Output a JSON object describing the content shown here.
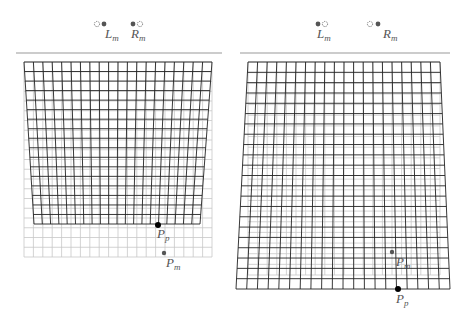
{
  "panels": [
    {
      "name": "left-panel",
      "rule": {
        "x1": 16,
        "x2": 222,
        "y": 53
      },
      "eyes": [
        {
          "label": "L",
          "sub": "m",
          "dashed_x": 97,
          "solid_x": 104,
          "y": 24,
          "label_x": 105,
          "label_y": 27
        },
        {
          "label": "R",
          "sub": "m",
          "dashed_x": 140,
          "solid_x": 133,
          "y": 24,
          "label_x": 131,
          "label_y": 27
        }
      ],
      "underlay": {
        "tl": [
          24,
          62
        ],
        "tr": [
          212,
          62
        ],
        "bl": [
          24,
          257
        ],
        "br": [
          212,
          257
        ],
        "cols": 20,
        "rows": 20
      },
      "grid": {
        "tl": [
          24,
          62
        ],
        "tr": [
          212,
          62
        ],
        "bl": [
          34,
          224
        ],
        "br": [
          200,
          224
        ],
        "cols": 20,
        "rows": 17
      },
      "points": [
        {
          "name": "Pp",
          "label": "P",
          "sub": "p",
          "x": 158,
          "y": 225,
          "r": 3,
          "color": "#000000",
          "label_x": 157,
          "label_y": 227
        },
        {
          "name": "Pm",
          "label": "P",
          "sub": "m",
          "x": 164,
          "y": 253,
          "r": 2.2,
          "color": "#555555",
          "label_x": 166,
          "label_y": 256
        }
      ]
    },
    {
      "name": "right-panel",
      "rule": {
        "x1": 240,
        "x2": 450,
        "y": 53
      },
      "eyes": [
        {
          "label": "L",
          "sub": "m",
          "dashed_x": 325,
          "solid_x": 318,
          "y": 24,
          "label_x": 317,
          "label_y": 27
        },
        {
          "label": "R",
          "sub": "m",
          "dashed_x": 370,
          "solid_x": 378,
          "y": 24,
          "label_x": 383,
          "label_y": 27
        }
      ],
      "underlay": {
        "tl": [
          248,
          62
        ],
        "tr": [
          440,
          62
        ],
        "bl": [
          248,
          275
        ],
        "br": [
          440,
          275
        ],
        "cols": 20,
        "rows": 20
      },
      "grid": {
        "tl": [
          248,
          62
        ],
        "tr": [
          440,
          62
        ],
        "bl": [
          236,
          289
        ],
        "br": [
          450,
          289
        ],
        "cols": 20,
        "rows": 22
      },
      "points": [
        {
          "name": "Pm",
          "label": "P",
          "sub": "m",
          "x": 392,
          "y": 252,
          "r": 2.2,
          "color": "#555555",
          "label_x": 396,
          "label_y": 255
        },
        {
          "name": "Pp",
          "label": "P",
          "sub": "p",
          "x": 398,
          "y": 289,
          "r": 3,
          "color": "#000000",
          "label_x": 396,
          "label_y": 292
        }
      ]
    }
  ],
  "colors": {
    "grid": "#222222",
    "underlay": "#c8c8c8",
    "rule": "#999999",
    "eye": "#555555"
  }
}
